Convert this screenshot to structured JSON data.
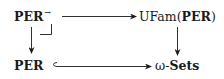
{
  "diagram": {
    "type": "pullback-square",
    "nodes": {
      "top_left": {
        "main": "PER",
        "superscript": "→"
      },
      "top_right": {
        "prefix": "UFam(",
        "main": "PER",
        "suffix": ")"
      },
      "bottom_left": {
        "main": "PER"
      },
      "bottom_right": {
        "prefix": "ω-",
        "main": "Sets"
      }
    },
    "edges": [
      {
        "from": "top_left",
        "to": "top_right",
        "style": "arrow"
      },
      {
        "from": "top_left",
        "to": "bottom_left",
        "style": "arrow"
      },
      {
        "from": "top_right",
        "to": "bottom_right",
        "style": "arrow"
      },
      {
        "from": "bottom_left",
        "to": "bottom_right",
        "style": "hook-arrow (inclusion)"
      }
    ],
    "pullback_marker": "┘",
    "colors": {
      "ink": "#1a1a1a",
      "background": "#ffffff"
    }
  }
}
